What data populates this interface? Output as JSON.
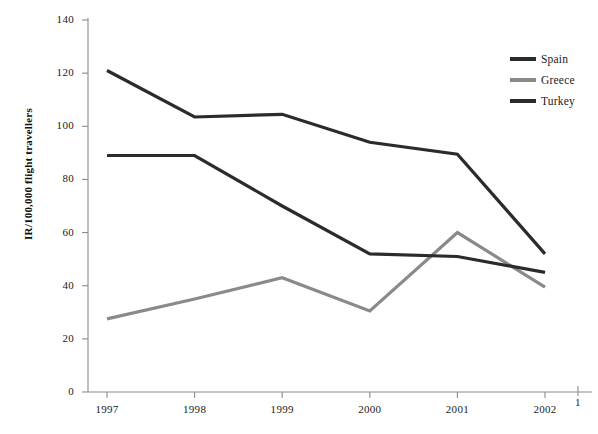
{
  "chart_data": {
    "type": "line",
    "title": "",
    "xlabel": "",
    "ylabel": "IR/100,000 flight travellers",
    "categories": [
      "1997",
      "1998",
      "1999",
      "2000",
      "2001",
      "2002"
    ],
    "ylim": [
      0,
      140
    ],
    "yticks": [
      0,
      20,
      40,
      60,
      80,
      100,
      120,
      140
    ],
    "grid": false,
    "legend_position": "top-right",
    "series": [
      {
        "name": "Spain",
        "color": "#2b2b2b",
        "values": [
          121,
          103.5,
          104.5,
          94,
          89.5,
          52
        ]
      },
      {
        "name": "Greece",
        "color": "#8a8a8a",
        "values": [
          27.5,
          35,
          43,
          30.5,
          60,
          39.5
        ]
      },
      {
        "name": "Turkey",
        "color": "#2b2b2b",
        "values": [
          89,
          89,
          70,
          52,
          51,
          45
        ]
      }
    ],
    "annotations": [
      {
        "text": "1",
        "note": "stray tick label at far right of x-axis"
      }
    ]
  },
  "axis": {
    "ytick_labels": [
      "0",
      "20",
      "40",
      "60",
      "80",
      "100",
      "120",
      "140"
    ],
    "xtick_labels": [
      "1997",
      "1998",
      "1999",
      "2000",
      "2001",
      "2002"
    ]
  },
  "legend": {
    "items": [
      {
        "label": "Spain"
      },
      {
        "label": "Greece"
      },
      {
        "label": "Turkey"
      }
    ]
  },
  "colors": {
    "axis": "#8c8c8c",
    "spain": "#2b2b2b",
    "greece": "#8a8a8a",
    "turkey": "#2b2b2b",
    "background": "#ffffff"
  }
}
